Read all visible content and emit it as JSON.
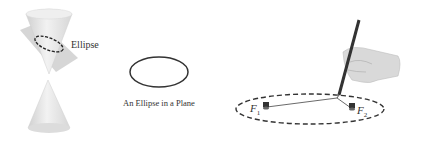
{
  "figure": {
    "panels": [
      {
        "id": "cone-section",
        "description": "Double cone cut by a tilted plane producing an ellipse",
        "label": "Ellipse"
      },
      {
        "id": "ellipse-plane",
        "description": "Plain ellipse drawn in a plane",
        "caption": "An Ellipse in a Plane"
      },
      {
        "id": "string-construction",
        "description": "Hand with pencil drawing a dashed ellipse using a string fixed at two pins",
        "focus_1": {
          "letter": "F",
          "sub": "1"
        },
        "focus_2": {
          "letter": "F",
          "sub": "2"
        }
      }
    ],
    "colors": {
      "cone_fill": "#e6e6e6",
      "plane_fill": "#d2d2d2",
      "stroke": "#333333",
      "background": "#ffffff"
    }
  }
}
